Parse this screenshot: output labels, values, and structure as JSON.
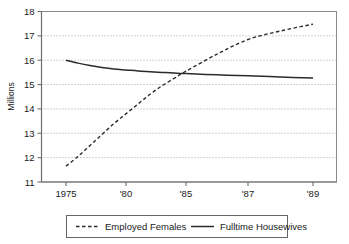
{
  "chart_data": {
    "type": "line",
    "title": "",
    "xlabel": "",
    "ylabel": "Millions",
    "ylim": [
      11,
      18
    ],
    "xlim": [
      1975,
      1989
    ],
    "grid": true,
    "grid_axis": "y",
    "legend_position": "bottom",
    "y_ticks": [
      "18",
      "17",
      "16",
      "15",
      "14",
      "13",
      "12",
      "11"
    ],
    "y_tick_values": [
      18,
      17,
      16,
      15,
      14,
      13,
      12,
      11
    ],
    "x_ticks": [
      "1975",
      "'80",
      "'85",
      "'87",
      "'89"
    ],
    "x_tick_values": [
      1975,
      1980,
      1985,
      1987,
      1989
    ],
    "x": [
      1975,
      1976,
      1977,
      1978,
      1979,
      1980,
      1981,
      1982,
      1983,
      1984,
      1985,
      1986,
      1987,
      1988,
      1989
    ],
    "series": [
      {
        "name": "Employed Females",
        "style": "dashed",
        "color": "#2b2b2b",
        "values": [
          11.65,
          12.05,
          12.5,
          12.95,
          13.4,
          13.8,
          14.2,
          14.6,
          14.95,
          15.25,
          15.55,
          16.25,
          16.85,
          17.2,
          17.48
        ]
      },
      {
        "name": "Fulltime Housewives",
        "style": "solid",
        "color": "#2b2b2b",
        "values": [
          16.0,
          15.88,
          15.78,
          15.7,
          15.64,
          15.6,
          15.56,
          15.53,
          15.5,
          15.47,
          15.45,
          15.4,
          15.36,
          15.31,
          15.27
        ]
      }
    ]
  },
  "legend": {
    "items": [
      {
        "label": "Employed Females",
        "marker": "dashed-line-swatch"
      },
      {
        "label": "Fulltime Housewives",
        "marker": "solid-line-swatch"
      }
    ]
  },
  "colors": {
    "line": "#2b2b2b",
    "grid": "#9a9a9a",
    "axis": "#6e6e6e",
    "plot_border": "#8a8a8a",
    "background": "#ffffff",
    "text": "#1a1a1a"
  }
}
